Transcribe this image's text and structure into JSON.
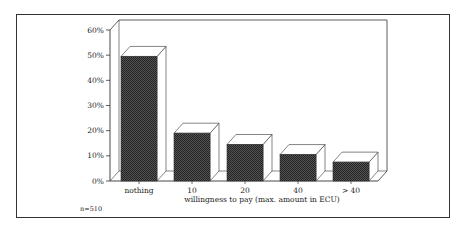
{
  "chart_data": {
    "type": "bar",
    "style": "3d",
    "title": "",
    "categories": [
      "nothing",
      "10",
      "20",
      "40",
      "> 40"
    ],
    "values": [
      49.5,
      19,
      14.5,
      10.5,
      7.5
    ],
    "xlabel": "willingness to pay (max. amount in ECU)",
    "ylabel": "",
    "ylim": [
      0,
      60
    ],
    "yticks": [
      "0%",
      "10%",
      "20%",
      "30%",
      "40%",
      "50%",
      "60%"
    ],
    "grid": false,
    "legend": null,
    "annotation": "n=510",
    "colors": {
      "bar_fill": "#3a3a3a",
      "bar_side": "#ffffff",
      "outline": "#333333"
    }
  }
}
